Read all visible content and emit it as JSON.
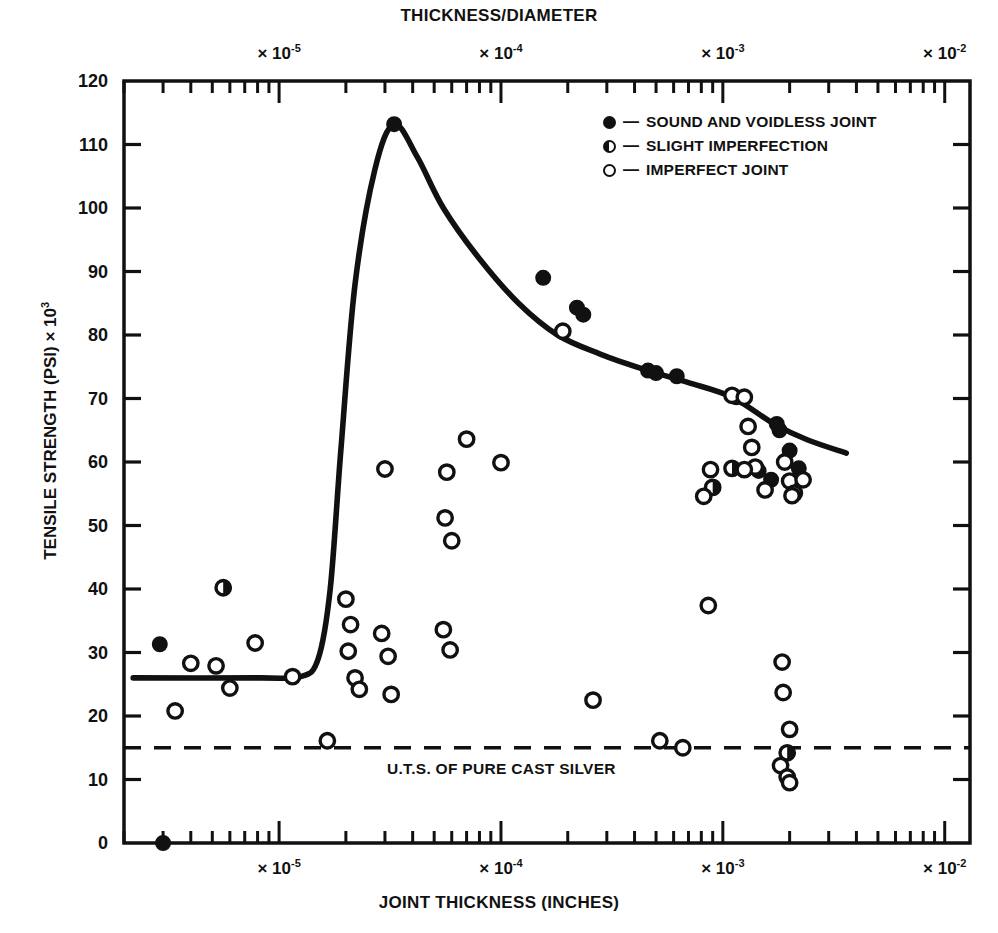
{
  "titles": {
    "top": "THICKNESS/DIAMETER",
    "bottom": "JOINT THICKNESS (INCHES)",
    "ylabel_main": "TENSILE STRENGTH (PSI) × 10",
    "ylabel_exp": "3"
  },
  "legend": {
    "dash": "—",
    "items": [
      {
        "marker": "full",
        "label": "SOUND AND VOIDLESS JOINT"
      },
      {
        "marker": "half",
        "label": "SLIGHT IMPERFECTION"
      },
      {
        "marker": "open",
        "label": "IMPERFECT JOINT"
      }
    ]
  },
  "annotations": {
    "uts_label": "U.T.S. OF PURE CAST SILVER",
    "uts_value": 15
  },
  "axes": {
    "y_ticks": [
      "0",
      "10",
      "20",
      "30",
      "40",
      "50",
      "60",
      "70",
      "80",
      "90",
      "100",
      "110",
      "120"
    ],
    "x_decade_labels_top": [
      "× 10",
      "× 10",
      "× 10",
      "× 10"
    ],
    "x_decade_exponents_top": [
      "-5",
      "-4",
      "-3",
      "-2"
    ],
    "x_decade_labels_bottom": [
      "× 10",
      "× 10",
      "× 10",
      "× 10"
    ],
    "x_decade_exponents_bottom": [
      "-5",
      "-4",
      "-3",
      "-2"
    ]
  },
  "chart_data": {
    "type": "scatter",
    "title": "",
    "xlabel": "JOINT THICKNESS (INCHES)",
    "ylabel": "TENSILE STRENGTH (PSI) × 10^3",
    "top_axis_label": "THICKNESS/DIAMETER",
    "xscale": "log",
    "xlim": [
      2e-06,
      0.013
    ],
    "ylim": [
      0,
      120
    ],
    "yticks": [
      0,
      10,
      20,
      30,
      40,
      50,
      60,
      70,
      80,
      90,
      100,
      110,
      120
    ],
    "x_decades_bottom": [
      1e-05,
      0.0001,
      0.001,
      0.01
    ],
    "x_decades_top": [
      1e-05,
      0.0001,
      0.001,
      0.01
    ],
    "grid": false,
    "legend_position": "top-right",
    "reference_line": {
      "label": "U.T.S. OF PURE CAST SILVER",
      "y": 15,
      "style": "dashed"
    },
    "series": [
      {
        "name": "SOUND AND VOIDLESS JOINT",
        "marker": "filled-circle",
        "points": [
          {
            "x": 3e-06,
            "y": 0
          },
          {
            "x": 2.9e-06,
            "y": 31.3
          },
          {
            "x": 3.3e-05,
            "y": 113.2
          },
          {
            "x": 0.000155,
            "y": 89.0
          },
          {
            "x": 0.00022,
            "y": 84.3
          },
          {
            "x": 0.000235,
            "y": 83.2
          },
          {
            "x": 0.00046,
            "y": 74.4
          },
          {
            "x": 0.0005,
            "y": 74.0
          },
          {
            "x": 0.00062,
            "y": 73.5
          },
          {
            "x": 0.00115,
            "y": 70.2
          },
          {
            "x": 0.00175,
            "y": 66.0
          },
          {
            "x": 0.0018,
            "y": 65.0
          },
          {
            "x": 0.002,
            "y": 61.8
          },
          {
            "x": 0.00145,
            "y": 58.6
          },
          {
            "x": 0.0022,
            "y": 59.0
          },
          {
            "x": 0.00165,
            "y": 57.2
          }
        ]
      },
      {
        "name": "SLIGHT IMPERFECTION",
        "marker": "half-filled-circle",
        "points": [
          {
            "x": 5.6e-06,
            "y": 40.2
          },
          {
            "x": 0.0009,
            "y": 56.0
          },
          {
            "x": 0.0011,
            "y": 59.0
          },
          {
            "x": 0.00195,
            "y": 14.2
          }
        ]
      },
      {
        "name": "IMPERFECT JOINT",
        "marker": "open-circle",
        "points": [
          {
            "x": 3.4e-06,
            "y": 20.8
          },
          {
            "x": 4e-06,
            "y": 28.3
          },
          {
            "x": 5.2e-06,
            "y": 27.9
          },
          {
            "x": 6e-06,
            "y": 24.4
          },
          {
            "x": 7.8e-06,
            "y": 31.5
          },
          {
            "x": 1.15e-05,
            "y": 26.2
          },
          {
            "x": 1.65e-05,
            "y": 16.1
          },
          {
            "x": 2e-05,
            "y": 38.4
          },
          {
            "x": 2.1e-05,
            "y": 34.4
          },
          {
            "x": 2.05e-05,
            "y": 30.2
          },
          {
            "x": 2.2e-05,
            "y": 26.0
          },
          {
            "x": 2.3e-05,
            "y": 24.2
          },
          {
            "x": 2.9e-05,
            "y": 33.0
          },
          {
            "x": 3.1e-05,
            "y": 29.4
          },
          {
            "x": 3.2e-05,
            "y": 23.4
          },
          {
            "x": 3e-05,
            "y": 58.9
          },
          {
            "x": 5.5e-05,
            "y": 33.6
          },
          {
            "x": 5.9e-05,
            "y": 30.4
          },
          {
            "x": 5.6e-05,
            "y": 51.2
          },
          {
            "x": 6e-05,
            "y": 47.6
          },
          {
            "x": 5.7e-05,
            "y": 58.4
          },
          {
            "x": 7e-05,
            "y": 63.6
          },
          {
            "x": 0.0001,
            "y": 59.9
          },
          {
            "x": 0.00019,
            "y": 80.6
          },
          {
            "x": 0.00026,
            "y": 22.5
          },
          {
            "x": 0.00052,
            "y": 16.1
          },
          {
            "x": 0.00066,
            "y": 15.0
          },
          {
            "x": 0.00082,
            "y": 54.6
          },
          {
            "x": 0.00086,
            "y": 37.4
          },
          {
            "x": 0.00088,
            "y": 58.8
          },
          {
            "x": 0.0011,
            "y": 70.5
          },
          {
            "x": 0.00125,
            "y": 70.2
          },
          {
            "x": 0.0013,
            "y": 65.6
          },
          {
            "x": 0.00135,
            "y": 62.3
          },
          {
            "x": 0.0014,
            "y": 59.2
          },
          {
            "x": 0.00125,
            "y": 58.8
          },
          {
            "x": 0.00155,
            "y": 55.6
          },
          {
            "x": 0.0019,
            "y": 60.0
          },
          {
            "x": 0.002,
            "y": 57.0
          },
          {
            "x": 0.0021,
            "y": 55.1
          },
          {
            "x": 0.00205,
            "y": 54.7
          },
          {
            "x": 0.0023,
            "y": 57.2
          },
          {
            "x": 0.00185,
            "y": 28.5
          },
          {
            "x": 0.00187,
            "y": 23.7
          },
          {
            "x": 0.002,
            "y": 17.9
          },
          {
            "x": 0.00182,
            "y": 12.2
          },
          {
            "x": 0.00195,
            "y": 10.4
          },
          {
            "x": 0.002,
            "y": 9.5
          }
        ]
      }
    ],
    "fit_curve": {
      "name": "strength-vs-thickness trend",
      "description": "plateau near 26 at very small thickness, sharp rise to peak 113 near 3.3e-5 in, then gradual decay to ~61 at 4e-3 in",
      "points": [
        {
          "x": 2.2e-06,
          "y": 26.0
        },
        {
          "x": 8e-06,
          "y": 26.0
        },
        {
          "x": 1.25e-05,
          "y": 26.2
        },
        {
          "x": 1.5e-05,
          "y": 29.0
        },
        {
          "x": 1.7e-05,
          "y": 40.0
        },
        {
          "x": 1.9e-05,
          "y": 62.0
        },
        {
          "x": 2.2e-05,
          "y": 88.0
        },
        {
          "x": 2.7e-05,
          "y": 106.0
        },
        {
          "x": 3.3e-05,
          "y": 113.2
        },
        {
          "x": 4.2e-05,
          "y": 108.0
        },
        {
          "x": 5.5e-05,
          "y": 100.0
        },
        {
          "x": 8e-05,
          "y": 92.0
        },
        {
          "x": 0.00012,
          "y": 85.0
        },
        {
          "x": 0.00018,
          "y": 80.0
        },
        {
          "x": 0.00028,
          "y": 77.0
        },
        {
          "x": 0.00045,
          "y": 74.5
        },
        {
          "x": 0.0007,
          "y": 72.5
        },
        {
          "x": 0.0011,
          "y": 70.2
        },
        {
          "x": 0.0017,
          "y": 66.0
        },
        {
          "x": 0.0024,
          "y": 63.5
        },
        {
          "x": 0.0036,
          "y": 61.4
        }
      ]
    }
  }
}
